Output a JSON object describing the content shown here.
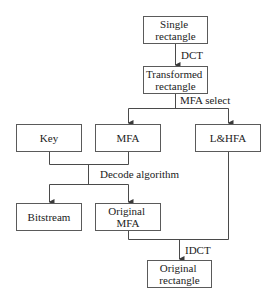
{
  "diagram": {
    "type": "flowchart",
    "nodes": {
      "single_rectangle": {
        "lines": [
          "Single",
          "rectangle"
        ]
      },
      "transformed_rectangle": {
        "lines": [
          "Transformed",
          "rectangle"
        ]
      },
      "key": {
        "lines": [
          "Key"
        ]
      },
      "mfa": {
        "lines": [
          "MFA"
        ]
      },
      "lhfa": {
        "lines": [
          "L&HFA"
        ]
      },
      "bitstream": {
        "lines": [
          "Bitstream"
        ]
      },
      "original_mfa": {
        "lines": [
          "Original",
          "MFA"
        ]
      },
      "original_rectangle": {
        "lines": [
          "Original",
          "rectangle"
        ]
      }
    },
    "edges": {
      "dct": "DCT",
      "mfa_select": "MFA select",
      "decode_algorithm": "Decode algorithm",
      "idct": "IDCT"
    },
    "colors": {
      "stroke": "#4a4a4a",
      "text": "#222222",
      "background": "#ffffff"
    }
  }
}
